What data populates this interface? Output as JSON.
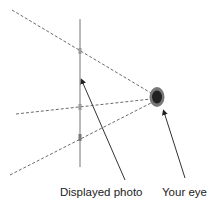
{
  "labels": {
    "photo": "Displayed photo",
    "eye": "Your eye"
  },
  "colors": {
    "line": "#555555",
    "eye_outer": "#777777",
    "eye_inner": "#222222"
  }
}
